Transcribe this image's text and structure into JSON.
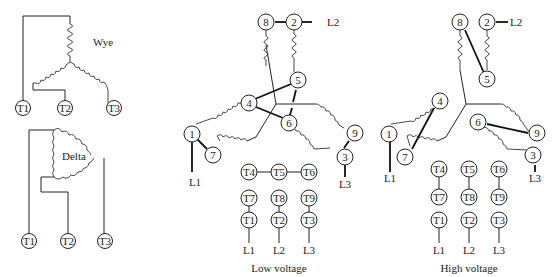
{
  "wye_diagram": {
    "label": "Wye",
    "terminals": [
      "T1",
      "T2",
      "T3"
    ]
  },
  "delta_diagram": {
    "label": "Delta",
    "terminals": [
      "T1",
      "T2",
      "T3"
    ]
  },
  "low_voltage_diagram": {
    "caption": "Low voltage",
    "nodes": [
      "1",
      "2",
      "3",
      "4",
      "5",
      "6",
      "7",
      "8",
      "9"
    ],
    "line_labels": {
      "l1": "L1",
      "l2": "L2",
      "l3": "L3"
    },
    "connection_table": {
      "row1": [
        "T4",
        "T5",
        "T6"
      ],
      "row2": [
        "T7",
        "T8",
        "T9"
      ],
      "row3": [
        "T1",
        "T2",
        "T3"
      ],
      "lines": [
        "L1",
        "L2",
        "L3"
      ]
    }
  },
  "high_voltage_diagram": {
    "caption": "High voltage",
    "nodes": [
      "1",
      "2",
      "3",
      "4",
      "5",
      "6",
      "7",
      "8",
      "9"
    ],
    "line_labels": {
      "l1": "L1",
      "l2": "L2",
      "l3": "L3"
    },
    "connection_table": {
      "row1": [
        "T4",
        "T5",
        "T6"
      ],
      "row2": [
        "T7",
        "T8",
        "T9"
      ],
      "row3": [
        "T1",
        "T2",
        "T3"
      ],
      "lines": [
        "L1",
        "L2",
        "L3"
      ]
    }
  }
}
